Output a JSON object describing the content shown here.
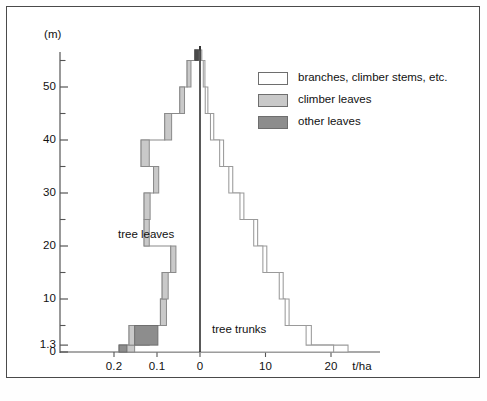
{
  "figure": {
    "axis_unit_label": "t/ha",
    "y_axis_unit": "(m)",
    "annotations": [
      {
        "name": "tree-leaves",
        "text": "tree leaves",
        "x": 118,
        "y": 228
      },
      {
        "name": "tree-trunks",
        "text": "tree trunks",
        "x": 212,
        "y": 323
      }
    ]
  },
  "legend": {
    "position": "top-right",
    "items": [
      {
        "label": "branches, climber stems, etc.",
        "color": "#ffffff",
        "border": "#6e6e6e"
      },
      {
        "label": "climber leaves",
        "color": "#c9c9c9",
        "border": "#6e6e6e"
      },
      {
        "label": "other leaves",
        "color": "#8d8d8d",
        "border": "#6e6e6e"
      }
    ]
  },
  "chart_data": {
    "type": "bar",
    "orientation": "horizontal-stacked-diverging",
    "title": "",
    "xlabel": "t/ha",
    "ylabel": "(m)",
    "grid": false,
    "legend_position": "top-right",
    "y_tick_labels": [
      "0",
      "1.3",
      "10",
      "20",
      "30",
      "40",
      "50"
    ],
    "y_tick_values": [
      0,
      1.3,
      10,
      20,
      30,
      40,
      50
    ],
    "y_minor_ticks": [
      5,
      15,
      25,
      35,
      45,
      55
    ],
    "ylim": [
      0,
      57
    ],
    "x_tick_labels_left": [
      "0.2",
      "0.1"
    ],
    "x_tick_values_left": [
      0.2,
      0.1
    ],
    "x_tick_labels_right": [
      "10",
      "20"
    ],
    "x_tick_values_right": [
      10,
      20
    ],
    "x_center_label": "0",
    "xlim_left": [
      0.235,
      0
    ],
    "xlim_right": [
      0,
      25
    ],
    "left_axis_note": "leaf biomass, t/ha (increasing leftward)",
    "right_axis_note": "stem/trunk biomass, t/ha (increasing rightward)",
    "layers": [
      {
        "name": "tree leaves",
        "side": "left",
        "color": "#ffffff",
        "note": "outer profile of left histogram, labelled 'tree leaves'",
        "bins": [
          {
            "z_bottom": 0,
            "z_top": 1.3,
            "value": 0.188
          },
          {
            "z_bottom": 1.3,
            "z_top": 5,
            "value": 0.165
          },
          {
            "z_bottom": 5,
            "z_top": 10,
            "value": 0.092
          },
          {
            "z_bottom": 10,
            "z_top": 15,
            "value": 0.088
          },
          {
            "z_bottom": 15,
            "z_top": 20,
            "value": 0.068
          },
          {
            "z_bottom": 20,
            "z_top": 25,
            "value": 0.13
          },
          {
            "z_bottom": 25,
            "z_top": 30,
            "value": 0.13
          },
          {
            "z_bottom": 30,
            "z_top": 35,
            "value": 0.108
          },
          {
            "z_bottom": 35,
            "z_top": 40,
            "value": 0.137
          },
          {
            "z_bottom": 40,
            "z_top": 45,
            "value": 0.082
          },
          {
            "z_bottom": 45,
            "z_top": 50,
            "value": 0.047
          },
          {
            "z_bottom": 50,
            "z_top": 55,
            "value": 0.03
          },
          {
            "z_bottom": 55,
            "z_top": 57,
            "value": 0.012
          }
        ]
      },
      {
        "name": "climber leaves",
        "side": "left",
        "color": "#c9c9c9",
        "note": "shaded band at the outer edge of each left bin",
        "bins": [
          {
            "z_bottom": 0,
            "z_top": 1.3,
            "from": 0.188,
            "to": 0.152
          },
          {
            "z_bottom": 1.3,
            "z_top": 5,
            "from": 0.165,
            "to": 0.118
          },
          {
            "z_bottom": 5,
            "z_top": 10,
            "from": 0.092,
            "to": 0.078
          },
          {
            "z_bottom": 10,
            "z_top": 15,
            "from": 0.088,
            "to": 0.074
          },
          {
            "z_bottom": 15,
            "z_top": 20,
            "from": 0.068,
            "to": 0.056
          },
          {
            "z_bottom": 20,
            "z_top": 25,
            "from": 0.13,
            "to": 0.118
          },
          {
            "z_bottom": 25,
            "z_top": 30,
            "from": 0.13,
            "to": 0.116
          },
          {
            "z_bottom": 30,
            "z_top": 35,
            "from": 0.108,
            "to": 0.096
          },
          {
            "z_bottom": 35,
            "z_top": 40,
            "from": 0.137,
            "to": 0.118
          },
          {
            "z_bottom": 40,
            "z_top": 45,
            "from": 0.082,
            "to": 0.066
          },
          {
            "z_bottom": 45,
            "z_top": 50,
            "from": 0.047,
            "to": 0.036
          },
          {
            "z_bottom": 50,
            "z_top": 55,
            "from": 0.03,
            "to": 0.021
          },
          {
            "z_bottom": 55,
            "z_top": 57,
            "from": 0.012,
            "to": 0.004
          }
        ]
      },
      {
        "name": "other leaves",
        "side": "left",
        "color": "#8d8d8d",
        "note": "dark inner blocks present only in the lowest two bins",
        "bins": [
          {
            "z_bottom": 0,
            "z_top": 1.3,
            "from": 0.188,
            "to": 0.17
          },
          {
            "z_bottom": 1.3,
            "z_top": 5,
            "from": 0.152,
            "to": 0.098
          }
        ]
      },
      {
        "name": "tree trunks",
        "side": "right",
        "color": "#ffffff",
        "note": "inner stepped outline on the right, labelled 'tree trunks'",
        "bins": [
          {
            "z_bottom": 0,
            "z_top": 1.3,
            "value": 20.4
          },
          {
            "z_bottom": 1.3,
            "z_top": 5,
            "value": 16.2
          },
          {
            "z_bottom": 5,
            "z_top": 10,
            "value": 13.0
          },
          {
            "z_bottom": 10,
            "z_top": 15,
            "value": 12.1
          },
          {
            "z_bottom": 15,
            "z_top": 20,
            "value": 9.6
          },
          {
            "z_bottom": 20,
            "z_top": 25,
            "value": 8.2
          },
          {
            "z_bottom": 25,
            "z_top": 30,
            "value": 6.1
          },
          {
            "z_bottom": 30,
            "z_top": 35,
            "value": 4.4
          },
          {
            "z_bottom": 35,
            "z_top": 40,
            "value": 3.0
          },
          {
            "z_bottom": 40,
            "z_top": 45,
            "value": 1.6
          },
          {
            "z_bottom": 45,
            "z_top": 50,
            "value": 0.8
          },
          {
            "z_bottom": 50,
            "z_top": 55,
            "value": 0.5
          },
          {
            "z_bottom": 55,
            "z_top": 57,
            "value": 0.15
          }
        ]
      },
      {
        "name": "branches, climber stems, etc.",
        "side": "right",
        "color": "#ffffff",
        "note": "outer stepped outline on the right, drawn just beyond the trunk outline",
        "bins": [
          {
            "z_bottom": 0,
            "z_top": 1.3,
            "value": 22.6
          },
          {
            "z_bottom": 1.3,
            "z_top": 5,
            "value": 17.0
          },
          {
            "z_bottom": 5,
            "z_top": 10,
            "value": 13.6
          },
          {
            "z_bottom": 10,
            "z_top": 15,
            "value": 12.7
          },
          {
            "z_bottom": 15,
            "z_top": 20,
            "value": 10.2
          },
          {
            "z_bottom": 20,
            "z_top": 25,
            "value": 8.8
          },
          {
            "z_bottom": 25,
            "z_top": 30,
            "value": 6.7
          },
          {
            "z_bottom": 30,
            "z_top": 35,
            "value": 5.0
          },
          {
            "z_bottom": 35,
            "z_top": 40,
            "value": 3.6
          },
          {
            "z_bottom": 40,
            "z_top": 45,
            "value": 2.1
          },
          {
            "z_bottom": 45,
            "z_top": 50,
            "value": 1.2
          },
          {
            "z_bottom": 50,
            "z_top": 55,
            "value": 0.75
          },
          {
            "z_bottom": 55,
            "z_top": 57,
            "value": 0.28
          }
        ]
      }
    ]
  }
}
